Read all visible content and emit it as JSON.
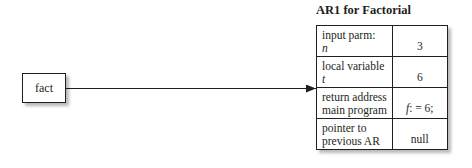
{
  "caller": {
    "label": "fact"
  },
  "activation_record": {
    "title": "AR1 for Factorial",
    "rows": [
      {
        "label_line1": "input parm:",
        "label_line2": "n",
        "label_line2_italic": true,
        "value": "3"
      },
      {
        "label_line1": "local variable",
        "label_line2": "t",
        "label_line2_italic": true,
        "value": "6"
      },
      {
        "label_line1": "return address",
        "label_line2": "main program",
        "label_line2_italic": false,
        "value_italic_part": "f",
        "value_rest": ": = 6;"
      },
      {
        "label_line1": "pointer to",
        "label_line2": "previous AR",
        "label_line2_italic": false,
        "value": "null"
      }
    ]
  },
  "arrow": {
    "from": "fact",
    "to": "return-address-row"
  }
}
